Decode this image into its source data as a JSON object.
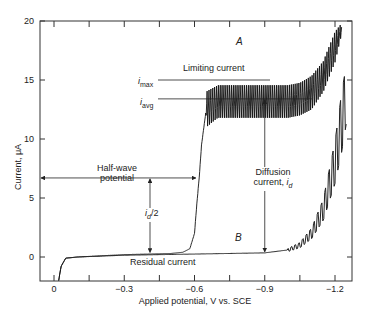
{
  "chart_data": {
    "type": "line",
    "title": "",
    "xlabel": "Applied potential, V vs. SCE",
    "ylabel": "Current, μA",
    "xlim": [
      0.05,
      -1.28
    ],
    "ylim": [
      -2.1,
      20
    ],
    "x_ticks": [
      "0",
      "−0.3",
      "−0.6",
      "−0.9",
      "−1.2"
    ],
    "x_tick_values": [
      0,
      -0.3,
      -0.6,
      -0.9,
      -1.2
    ],
    "y_ticks": [
      "0",
      "5",
      "10",
      "15",
      "20"
    ],
    "y_tick_values": [
      0,
      5,
      10,
      15,
      20
    ],
    "grid": false,
    "legend": "none",
    "series": [
      {
        "name": "A",
        "description": "Polarogram with analyte: residual, sharp rise at about -0.6 V, oscillating limiting current, final rise past -1.1 V",
        "x": [
          -0.02,
          -0.03,
          -0.05,
          -0.1,
          -0.2,
          -0.3,
          -0.4,
          -0.5,
          -0.55,
          -0.58,
          -0.6,
          -0.61,
          -0.62,
          -0.63,
          -0.65,
          -0.7,
          -0.8,
          -0.9,
          -1.0,
          -1.05,
          -1.1,
          -1.15,
          -1.2,
          -1.23
        ],
        "y_avg": [
          -2.0,
          -0.8,
          -0.1,
          0.0,
          0.1,
          0.2,
          0.25,
          0.3,
          0.4,
          0.7,
          2.0,
          4.5,
          6.7,
          9.5,
          12.5,
          13.3,
          13.4,
          13.4,
          13.5,
          13.6,
          14.0,
          15.5,
          18.0,
          20.0
        ],
        "y_max": [
          null,
          null,
          null,
          null,
          null,
          null,
          null,
          null,
          null,
          null,
          null,
          null,
          null,
          null,
          14.5,
          15.0,
          15.0,
          15.0,
          15.0,
          15.2,
          15.8,
          17.0,
          19.5,
          20.0
        ],
        "y_min": [
          null,
          null,
          null,
          null,
          null,
          null,
          null,
          null,
          null,
          null,
          null,
          null,
          null,
          null,
          11.0,
          11.8,
          11.8,
          11.8,
          11.8,
          12.0,
          12.5,
          14.0,
          16.5,
          19.0
        ]
      },
      {
        "name": "B",
        "description": "Residual current (supporting electrolyte only)",
        "x": [
          -0.02,
          -0.03,
          -0.05,
          -0.1,
          -0.3,
          -0.6,
          -0.9,
          -1.0,
          -1.05,
          -1.1,
          -1.15,
          -1.2,
          -1.25
        ],
        "y": [
          -2.0,
          -0.8,
          -0.1,
          0.0,
          0.15,
          0.25,
          0.35,
          0.6,
          1.0,
          2.0,
          4.0,
          8.0,
          14.0
        ]
      }
    ],
    "annotations": [
      {
        "text": "A",
        "x": -0.57,
        "y": 17.2
      },
      {
        "text": "B",
        "x": -0.75,
        "y": 1.4
      },
      {
        "text": "Limiting current",
        "x": -0.65,
        "y": 15.8
      },
      {
        "text": "i_max",
        "x": -0.45,
        "y": 15.0
      },
      {
        "text": "i_avg",
        "x": -0.45,
        "y": 13.3
      },
      {
        "text": "Half-wave potential",
        "arrow_from_x": 0.03,
        "arrow_to_x": -0.61,
        "y": 6.7
      },
      {
        "text": "i_d/2",
        "arrow_x": -0.41,
        "y_from": 6.7,
        "y_to": 0.3
      },
      {
        "text": "Diffusion current, i_d",
        "arrow_x": -0.9,
        "y_from": 13.4,
        "y_to": 0.35
      },
      {
        "text": "Residual current",
        "x": -0.4,
        "y": -1.2
      }
    ]
  },
  "labels": {
    "curve_a": "A",
    "curve_b": "B",
    "limiting_current": "Limiting current",
    "i_max_i": "i",
    "i_max_sub": "max",
    "i_avg_i": "i",
    "i_avg_sub": "avg",
    "half_wave_1": "Half-wave",
    "half_wave_2": "potential",
    "id_half_i": "i",
    "id_half_sub": "d",
    "id_half_rest": "/2",
    "diffusion_1": "Diffusion",
    "diffusion_2": "current, ",
    "diffusion_i": "i",
    "diffusion_sub": "d",
    "residual_current": "Residual current",
    "xlabel": "Applied potential, V vs. SCE",
    "ylabel": "Current, μA"
  }
}
